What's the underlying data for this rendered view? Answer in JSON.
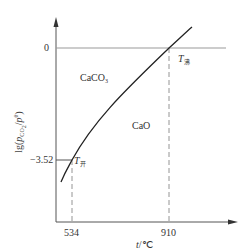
{
  "diagram": {
    "y_axis_label": "lg(pCO2/pθ)",
    "x_axis_label": "t/℃",
    "y_ticks": [
      {
        "label": "0",
        "value": 0
      },
      {
        "label": "−3.52",
        "value": -3.52
      }
    ],
    "x_ticks": [
      {
        "label": "534",
        "value": 534
      },
      {
        "label": "910",
        "value": 910
      }
    ],
    "regions": {
      "upper_left": "CaCO3",
      "lower_right": "CaO"
    },
    "points": {
      "t_kai": {
        "symbol": "T",
        "subscript": "开",
        "t": 534,
        "lg_p": -3.52
      },
      "t_fei": {
        "symbol": "T",
        "subscript": "沸",
        "t": 910,
        "lg_p": 0
      }
    },
    "colors": {
      "axis": "#555555",
      "curve": "#222222",
      "dashed": "#888888",
      "text": "#333333"
    }
  }
}
